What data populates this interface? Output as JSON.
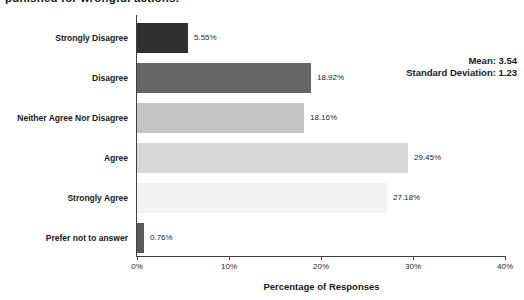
{
  "title_partial": "punished for wrongful actions.",
  "stats": {
    "mean_label": "Mean: 3.54",
    "std_label": "Standard Deviation: 1.23"
  },
  "chart_data": {
    "type": "bar",
    "orientation": "horizontal",
    "title_partial": "punished for wrongful actions.",
    "categories": [
      "Strongly Disagree",
      "Disagree",
      "Neither Agree Nor Disagree",
      "Agree",
      "Strongly Agree",
      "Prefer not to answer"
    ],
    "values": [
      5.55,
      18.92,
      18.16,
      29.45,
      27.18,
      0.76
    ],
    "value_labels": [
      "5.55%",
      "18.92%",
      "18.16%",
      "29.45%",
      "27.18%",
      "0.76%"
    ],
    "bar_colors": [
      "#303030",
      "#666666",
      "#c4c4c4",
      "#d9d9d9",
      "#f2f2f2",
      "#595959"
    ],
    "xlabel": "Percentage of Responses",
    "ylabel": "",
    "x_ticks": [
      "0%",
      "10%",
      "20%",
      "30%",
      "40%"
    ],
    "x_tick_values": [
      0,
      10,
      20,
      30,
      40
    ],
    "xlim": [
      0,
      40
    ],
    "grid": false,
    "legend": false,
    "annotations": [
      "Mean: 3.54",
      "Standard Deviation: 1.23"
    ]
  },
  "colors": {
    "background": "#ffffff",
    "axis": "#404040",
    "text": "#1a1a1a"
  }
}
